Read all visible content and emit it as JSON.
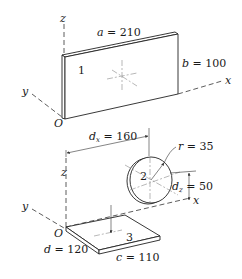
{
  "figure": {
    "top": {
      "axes": {
        "z": "z",
        "y": "y",
        "x": "x",
        "origin": "O"
      },
      "plate_label": "1",
      "dim_a": {
        "sym": "a",
        "eq": " = 210"
      },
      "dim_b": {
        "sym": "b",
        "eq": " = 100"
      }
    },
    "bottom": {
      "axes": {
        "z": "z",
        "y": "y",
        "x": "x",
        "origin": "O"
      },
      "disk_label": "2",
      "plate_label": "3",
      "dim_dx": {
        "sym": "d",
        "subscript": "x",
        "eq": " = 160"
      },
      "dim_r": {
        "sym": "r",
        "eq": " = 35"
      },
      "dim_dz": {
        "sym": "d",
        "subscript": "z",
        "eq": " = 50"
      },
      "dim_d": {
        "sym": "d",
        "eq": " = 120"
      },
      "dim_c": {
        "sym": "c",
        "eq": " = 110"
      }
    }
  }
}
